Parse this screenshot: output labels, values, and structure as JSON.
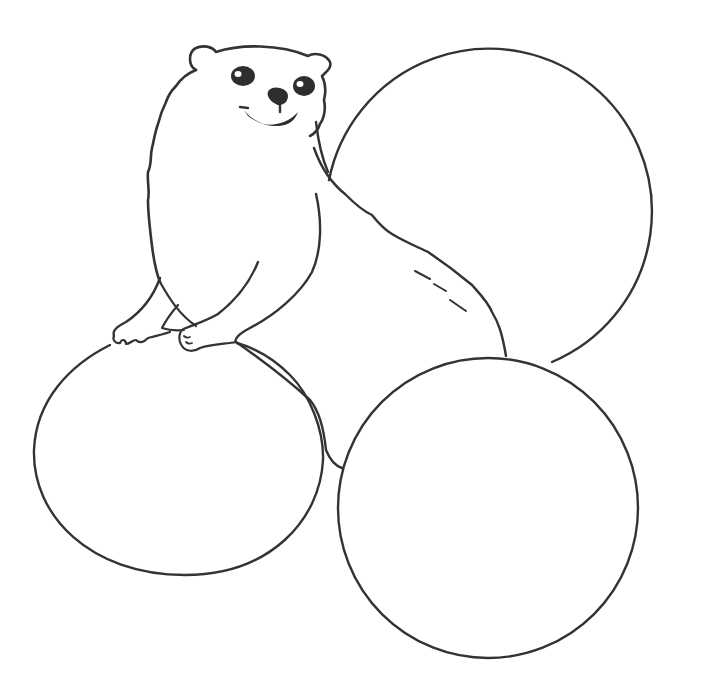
{
  "scene": {
    "description": "Line drawing coloring page: a smiling otter leaning on circles",
    "colors": {
      "background": "#ffffff",
      "stroke": "#333333",
      "fill_dark": "#2e2e2e"
    },
    "subject": "otter",
    "shapes": [
      {
        "name": "top-right-circle",
        "cx": 492,
        "cy": 210,
        "r": 163
      },
      {
        "name": "bottom-right-circle",
        "cx": 488,
        "cy": 508,
        "r": 150
      },
      {
        "name": "bottom-left-ellipse",
        "cx": 178,
        "cy": 457,
        "rx": 145,
        "ry": 118
      }
    ]
  }
}
